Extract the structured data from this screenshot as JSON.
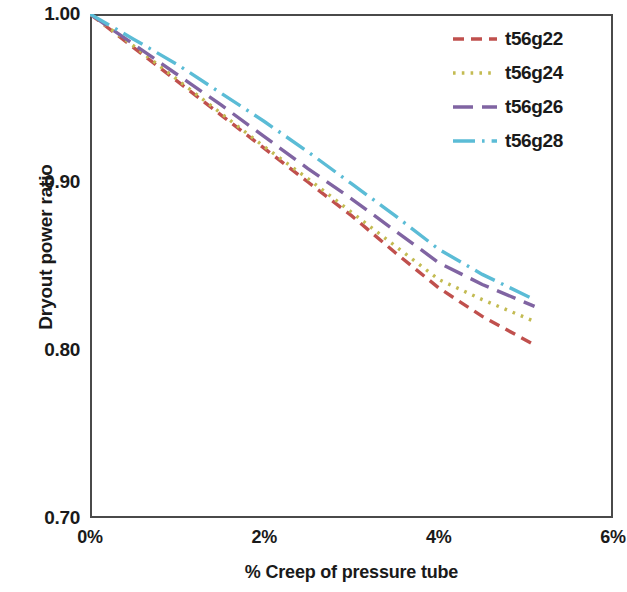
{
  "chart_data": {
    "type": "line",
    "title": "",
    "xlabel": "% Creep of pressure tube",
    "ylabel": "Dryout power ratio",
    "xlim": [
      0,
      6
    ],
    "ylim": [
      0.7,
      1.0
    ],
    "xticks": [
      "0%",
      "2%",
      "4%",
      "6%"
    ],
    "xtick_values": [
      0,
      2,
      4,
      6
    ],
    "yticks": [
      "1.00",
      "0.90",
      "0.80",
      "0.70"
    ],
    "ytick_values": [
      1.0,
      0.9,
      0.8,
      0.7
    ],
    "grid": false,
    "legend_position": "top-right",
    "x": [
      0,
      0.5,
      1,
      1.5,
      2,
      2.5,
      3,
      3.5,
      4,
      4.5,
      5.1
    ],
    "series": [
      {
        "name": "t56g22",
        "color": "#C0504D",
        "dash": "dashed",
        "values": [
          1.0,
          0.98,
          0.96,
          0.94,
          0.92,
          0.9,
          0.88,
          0.858,
          0.837,
          0.82,
          0.803
        ]
      },
      {
        "name": "t56g24",
        "color": "#C3BB52",
        "dash": "dotted",
        "values": [
          1.0,
          0.981,
          0.961,
          0.941,
          0.921,
          0.902,
          0.882,
          0.862,
          0.842,
          0.83,
          0.817
        ]
      },
      {
        "name": "t56g26",
        "color": "#8064A2",
        "dash": "long-dash",
        "values": [
          1.0,
          0.982,
          0.964,
          0.946,
          0.927,
          0.908,
          0.89,
          0.871,
          0.852,
          0.839,
          0.826
        ]
      },
      {
        "name": "t56g28",
        "color": "#5BBCD6",
        "dash": "dash-dot",
        "values": [
          1.0,
          0.985,
          0.97,
          0.953,
          0.936,
          0.918,
          0.899,
          0.88,
          0.86,
          0.845,
          0.83
        ]
      }
    ]
  },
  "axes": {
    "y_title": "Dryout power ratio",
    "x_title": "% Creep of pressure tube",
    "y_labels": [
      "1.00",
      "0.90",
      "0.80",
      "0.70"
    ],
    "x_labels": [
      "0%",
      "2%",
      "4%",
      "6%"
    ]
  },
  "legend": {
    "entries": [
      {
        "label": "t56g22"
      },
      {
        "label": "t56g24"
      },
      {
        "label": "t56g26"
      },
      {
        "label": "t56g28"
      }
    ]
  },
  "style": {
    "frame_color": "#4a4a4a",
    "background": "#ffffff",
    "text_color": "#1a1a1a"
  }
}
